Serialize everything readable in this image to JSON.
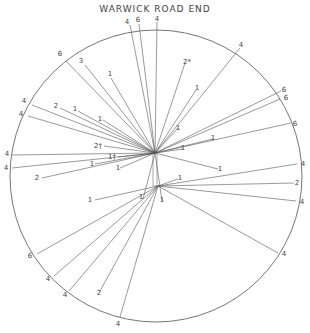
{
  "title": "WARWICK ROAD END",
  "colors": {
    "ink": "#555555",
    "circle": "#666666",
    "background": "#ffffff"
  },
  "field": {
    "cx": 156,
    "cy": 176,
    "r": 146
  },
  "origins": {
    "top": [
      155,
      153
    ],
    "bottom": [
      158,
      186
    ]
  },
  "shots": [
    {
      "from": "top",
      "to": [
        130,
        25
      ],
      "label": "4",
      "lx": 127,
      "ly": 24
    },
    {
      "from": "top",
      "to": [
        139,
        24
      ],
      "label": "6",
      "lx": 138,
      "ly": 22
    },
    {
      "from": "top",
      "to": [
        157,
        22
      ],
      "label": "4",
      "lx": 157,
      "ly": 21
    },
    {
      "from": "top",
      "to": [
        66,
        61
      ],
      "label": "6",
      "lx": 60,
      "ly": 56
    },
    {
      "from": "top",
      "to": [
        85,
        65
      ],
      "label": "3",
      "lx": 81,
      "ly": 63
    },
    {
      "from": "top",
      "to": [
        111,
        78
      ],
      "label": "1",
      "lx": 110,
      "ly": 76
    },
    {
      "from": "top",
      "to": [
        32,
        105
      ],
      "label": "4",
      "lx": 24,
      "ly": 103
    },
    {
      "from": "top",
      "to": [
        60,
        108
      ],
      "label": "2",
      "lx": 56,
      "ly": 108
    },
    {
      "from": "top",
      "to": [
        78,
        111
      ],
      "label": "1",
      "lx": 75,
      "ly": 111
    },
    {
      "from": "top",
      "to": [
        103,
        120
      ],
      "label": "1",
      "lx": 100,
      "ly": 121
    },
    {
      "from": "top",
      "to": [
        28,
        116
      ],
      "label": "4",
      "lx": 21,
      "ly": 116
    },
    {
      "from": "top",
      "to": [
        104,
        146
      ],
      "label": "2†",
      "lx": 98,
      "ly": 148
    },
    {
      "from": "top",
      "to": [
        12,
        155
      ],
      "label": "4",
      "lx": 7,
      "ly": 156
    },
    {
      "from": "top",
      "to": [
        118,
        157
      ],
      "label": "1†",
      "lx": 112,
      "ly": 159
    },
    {
      "from": "top",
      "to": [
        95,
        164
      ],
      "label": "1",
      "lx": 92,
      "ly": 166
    },
    {
      "from": "top",
      "to": [
        12,
        168
      ],
      "label": "4",
      "lx": 6,
      "ly": 170
    },
    {
      "from": "top",
      "to": [
        42,
        178
      ],
      "label": "2",
      "lx": 37,
      "ly": 180
    },
    {
      "from": "top",
      "to": [
        120,
        168
      ],
      "label": "1",
      "lx": 118,
      "ly": 170
    },
    {
      "from": "top",
      "to": [
        185,
        63
      ],
      "label": "2*",
      "lx": 187,
      "ly": 64
    },
    {
      "from": "top",
      "to": [
        196,
        90
      ],
      "label": "1",
      "lx": 197,
      "ly": 90
    },
    {
      "from": "top",
      "to": [
        178,
        128
      ],
      "label": "1",
      "lx": 178,
      "ly": 130
    },
    {
      "from": "top",
      "to": [
        240,
        48
      ],
      "label": "4",
      "lx": 241,
      "ly": 47
    },
    {
      "from": "top",
      "to": [
        281,
        91
      ],
      "label": "6",
      "lx": 284,
      "ly": 92
    },
    {
      "from": "top",
      "to": [
        280,
        99
      ],
      "label": "6",
      "lx": 286,
      "ly": 100
    },
    {
      "from": "top",
      "to": [
        291,
        123
      ],
      "label": "6",
      "lx": 295,
      "ly": 126
    },
    {
      "from": "top",
      "to": [
        213,
        139
      ],
      "label": "1",
      "lx": 213,
      "ly": 140
    },
    {
      "from": "top",
      "to": [
        218,
        169
      ],
      "label": "1",
      "lx": 220,
      "ly": 171
    },
    {
      "from": "top",
      "to": [
        183,
        149
      ],
      "label": "1",
      "lx": 183,
      "ly": 150
    },
    {
      "from": "bottom",
      "to": [
        297,
        164
      ],
      "label": "4",
      "lx": 303,
      "ly": 166
    },
    {
      "from": "bottom",
      "to": [
        294,
        183
      ],
      "label": "2",
      "lx": 297,
      "ly": 185
    },
    {
      "from": "bottom",
      "to": [
        296,
        201
      ],
      "label": "4",
      "lx": 302,
      "ly": 204
    },
    {
      "from": "bottom",
      "to": [
        278,
        253
      ],
      "label": "4",
      "lx": 284,
      "ly": 256
    },
    {
      "from": "bottom",
      "to": [
        178,
        179
      ],
      "label": "1",
      "lx": 180,
      "ly": 180
    },
    {
      "from": "bottom",
      "to": [
        95,
        200
      ],
      "label": "1",
      "lx": 90,
      "ly": 202
    },
    {
      "from": "bottom",
      "to": [
        37,
        254
      ],
      "label": "6",
      "lx": 30,
      "ly": 258
    },
    {
      "from": "bottom",
      "to": [
        54,
        276
      ],
      "label": "4",
      "lx": 48,
      "ly": 281
    },
    {
      "from": "bottom",
      "to": [
        69,
        291
      ],
      "label": "4",
      "lx": 65,
      "ly": 297
    },
    {
      "from": "bottom",
      "to": [
        100,
        291
      ],
      "label": "2",
      "lx": 99,
      "ly": 295
    },
    {
      "from": "bottom",
      "to": [
        120,
        317
      ],
      "label": "4",
      "lx": 118,
      "ly": 326
    },
    {
      "from": "top",
      "to": [
        143,
        199
      ],
      "label": "1",
      "lx": 141,
      "ly": 199
    },
    {
      "from": "top",
      "to": [
        162,
        201
      ],
      "label": "1",
      "lx": 162,
      "ly": 202
    }
  ]
}
